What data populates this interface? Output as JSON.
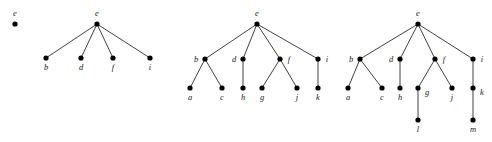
{
  "figure": {
    "type": "tree-sequence-diagram",
    "background_color": "#ffffff",
    "node_color": "#000000",
    "edge_color": "#2b2b2b",
    "label_color": "#1a1a1a",
    "node_radius": 2.6,
    "width": 492,
    "height": 142
  },
  "trees": [
    {
      "id": "tree-1",
      "root": "e",
      "nodes": [
        {
          "id": "n1-e",
          "label": "e",
          "x": 15,
          "y": 24,
          "label_x": 15,
          "label_y": 16,
          "label_pos": "above"
        }
      ],
      "edges": []
    },
    {
      "id": "tree-2",
      "root": "e",
      "nodes": [
        {
          "id": "n2-e",
          "label": "e",
          "x": 97,
          "y": 24,
          "label_x": 97,
          "label_y": 16,
          "label_pos": "above"
        },
        {
          "id": "n2-b",
          "label": "b",
          "x": 46,
          "y": 58,
          "label_x": 46,
          "label_y": 70,
          "label_pos": "below"
        },
        {
          "id": "n2-d",
          "label": "d",
          "x": 81,
          "y": 58,
          "label_x": 81,
          "label_y": 70,
          "label_pos": "below"
        },
        {
          "id": "n2-f",
          "label": "f",
          "x": 113,
          "y": 58,
          "label_x": 113,
          "label_y": 70,
          "label_pos": "below"
        },
        {
          "id": "n2-i",
          "label": "i",
          "x": 150,
          "y": 58,
          "label_x": 150,
          "label_y": 70,
          "label_pos": "below"
        }
      ],
      "edges": [
        {
          "from": "n2-e",
          "to": "n2-b"
        },
        {
          "from": "n2-e",
          "to": "n2-d"
        },
        {
          "from": "n2-e",
          "to": "n2-f"
        },
        {
          "from": "n2-e",
          "to": "n2-i"
        }
      ]
    },
    {
      "id": "tree-3",
      "root": "e",
      "nodes": [
        {
          "id": "n3-e",
          "label": "e",
          "x": 257,
          "y": 24,
          "label_x": 257,
          "label_y": 16,
          "label_pos": "above"
        },
        {
          "id": "n3-b",
          "label": "b",
          "x": 205,
          "y": 59,
          "label_x": 196,
          "label_y": 62,
          "label_pos": "left"
        },
        {
          "id": "n3-d",
          "label": "d",
          "x": 243,
          "y": 59,
          "label_x": 234,
          "label_y": 62,
          "label_pos": "left"
        },
        {
          "id": "n3-f",
          "label": "f",
          "x": 280,
          "y": 59,
          "label_x": 289,
          "label_y": 62,
          "label_pos": "right"
        },
        {
          "id": "n3-i",
          "label": "i",
          "x": 318,
          "y": 59,
          "label_x": 327,
          "label_y": 62,
          "label_pos": "right"
        },
        {
          "id": "n3-a",
          "label": "a",
          "x": 190,
          "y": 88,
          "label_x": 190,
          "label_y": 100,
          "label_pos": "below"
        },
        {
          "id": "n3-c",
          "label": "c",
          "x": 222,
          "y": 88,
          "label_x": 222,
          "label_y": 100,
          "label_pos": "below"
        },
        {
          "id": "n3-h",
          "label": "h",
          "x": 243,
          "y": 88,
          "label_x": 243,
          "label_y": 100,
          "label_pos": "below"
        },
        {
          "id": "n3-g",
          "label": "g",
          "x": 262,
          "y": 88,
          "label_x": 262,
          "label_y": 100,
          "label_pos": "below"
        },
        {
          "id": "n3-j",
          "label": "j",
          "x": 297,
          "y": 88,
          "label_x": 297,
          "label_y": 100,
          "label_pos": "below"
        },
        {
          "id": "n3-k",
          "label": "k",
          "x": 318,
          "y": 88,
          "label_x": 318,
          "label_y": 100,
          "label_pos": "below"
        }
      ],
      "edges": [
        {
          "from": "n3-e",
          "to": "n3-b"
        },
        {
          "from": "n3-e",
          "to": "n3-d"
        },
        {
          "from": "n3-e",
          "to": "n3-f"
        },
        {
          "from": "n3-e",
          "to": "n3-i"
        },
        {
          "from": "n3-b",
          "to": "n3-a"
        },
        {
          "from": "n3-b",
          "to": "n3-c"
        },
        {
          "from": "n3-d",
          "to": "n3-h"
        },
        {
          "from": "n3-f",
          "to": "n3-g"
        },
        {
          "from": "n3-f",
          "to": "n3-j"
        },
        {
          "from": "n3-i",
          "to": "n3-k"
        }
      ]
    },
    {
      "id": "tree-4",
      "root": "e",
      "nodes": [
        {
          "id": "n4-e",
          "label": "e",
          "x": 418,
          "y": 24,
          "label_x": 418,
          "label_y": 16,
          "label_pos": "above"
        },
        {
          "id": "n4-b",
          "label": "b",
          "x": 360,
          "y": 59,
          "label_x": 351,
          "label_y": 62,
          "label_pos": "left"
        },
        {
          "id": "n4-d",
          "label": "d",
          "x": 400,
          "y": 59,
          "label_x": 391,
          "label_y": 62,
          "label_pos": "left"
        },
        {
          "id": "n4-f",
          "label": "f",
          "x": 435,
          "y": 59,
          "label_x": 444,
          "label_y": 62,
          "label_pos": "right"
        },
        {
          "id": "n4-i",
          "label": "i",
          "x": 473,
          "y": 59,
          "label_x": 482,
          "label_y": 62,
          "label_pos": "right"
        },
        {
          "id": "n4-a",
          "label": "a",
          "x": 348,
          "y": 88,
          "label_x": 348,
          "label_y": 100,
          "label_pos": "below"
        },
        {
          "id": "n4-c",
          "label": "c",
          "x": 382,
          "y": 88,
          "label_x": 382,
          "label_y": 100,
          "label_pos": "below"
        },
        {
          "id": "n4-h",
          "label": "h",
          "x": 400,
          "y": 88,
          "label_x": 400,
          "label_y": 100,
          "label_pos": "below"
        },
        {
          "id": "n4-g",
          "label": "g",
          "x": 418,
          "y": 88,
          "label_x": 427,
          "label_y": 95,
          "label_pos": "right"
        },
        {
          "id": "n4-j",
          "label": "j",
          "x": 452,
          "y": 88,
          "label_x": 452,
          "label_y": 100,
          "label_pos": "below"
        },
        {
          "id": "n4-k",
          "label": "k",
          "x": 473,
          "y": 88,
          "label_x": 482,
          "label_y": 95,
          "label_pos": "right"
        },
        {
          "id": "n4-l",
          "label": "l",
          "x": 418,
          "y": 120,
          "label_x": 418,
          "label_y": 132,
          "label_pos": "below"
        },
        {
          "id": "n4-m",
          "label": "m",
          "x": 473,
          "y": 120,
          "label_x": 473,
          "label_y": 132,
          "label_pos": "below"
        }
      ],
      "edges": [
        {
          "from": "n4-e",
          "to": "n4-b"
        },
        {
          "from": "n4-e",
          "to": "n4-d"
        },
        {
          "from": "n4-e",
          "to": "n4-f"
        },
        {
          "from": "n4-e",
          "to": "n4-i"
        },
        {
          "from": "n4-b",
          "to": "n4-a"
        },
        {
          "from": "n4-b",
          "to": "n4-c"
        },
        {
          "from": "n4-d",
          "to": "n4-h"
        },
        {
          "from": "n4-f",
          "to": "n4-g"
        },
        {
          "from": "n4-f",
          "to": "n4-j"
        },
        {
          "from": "n4-i",
          "to": "n4-k"
        },
        {
          "from": "n4-g",
          "to": "n4-l"
        },
        {
          "from": "n4-k",
          "to": "n4-m"
        }
      ]
    }
  ]
}
